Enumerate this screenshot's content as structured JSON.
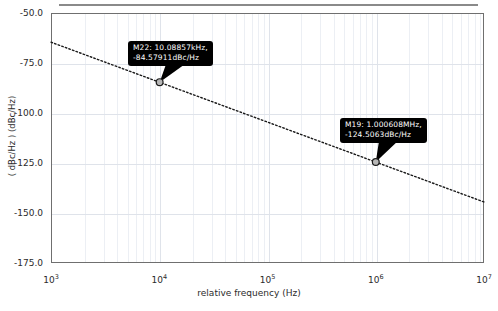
{
  "figure": {
    "title": "",
    "caption": ""
  },
  "axes": {
    "x": {
      "label": "relative frequency (Hz)",
      "scale": "log",
      "min": 1000,
      "max": 10000000,
      "tick_labels": [
        "10",
        "10",
        "10",
        "10",
        "10"
      ],
      "tick_exponents": [
        "3",
        "4",
        "5",
        "6",
        "7"
      ],
      "tick_values": [
        1000,
        10000,
        100000,
        1000000,
        10000000
      ]
    },
    "y": {
      "label": "( dBc/Hz ) (dBc/Hz)",
      "scale": "linear",
      "min": -175.0,
      "max": -50.0,
      "tick_labels": [
        "-50.0",
        "-75.0",
        "-100.0",
        "-125.0",
        "-150.0",
        "-175.0"
      ],
      "tick_values": [
        -50.0,
        -75.0,
        -100.0,
        -125.0,
        -150.0,
        -175.0
      ]
    }
  },
  "markers": [
    {
      "id": "M22",
      "line1": "M22: 10.08857kHz,",
      "line2": "-84.57911dBc/Hz",
      "freq_hz": 10088.57,
      "value_dbc_hz": -84.57911,
      "px": {
        "x": 162,
        "y": 84
      }
    },
    {
      "id": "M19",
      "line1": "M19: 1.000608MHz,",
      "line2": "-124.5063dBc/Hz",
      "freq_hz": 1000608,
      "value_dbc_hz": -124.5063,
      "px": {
        "x": 376,
        "y": 166
      }
    }
  ],
  "colors": {
    "trace": "#1a1a1a",
    "grid_major": "#dfe3ea",
    "grid_minor": "#eceff4",
    "frame": "#6f6f6f",
    "callout_bg": "#000000",
    "callout_fg": "#ffffff",
    "background": "#ffffff"
  },
  "chart_data": {
    "type": "line",
    "title": "",
    "xlabel": "relative frequency (Hz)",
    "ylabel": "( dBc/Hz ) (dBc/Hz)",
    "xscale": "log",
    "yscale": "linear",
    "xlim": [
      1000,
      10000000
    ],
    "ylim": [
      -175.0,
      -50.0
    ],
    "grid": true,
    "legend": "none",
    "linestyle": "dotted",
    "series": [
      {
        "name": "phase noise",
        "x": [
          1000,
          10000,
          100000,
          1000000,
          10000000
        ],
        "y": [
          -64.6,
          -84.6,
          -104.6,
          -124.5,
          -144.5
        ]
      }
    ],
    "annotations": [
      {
        "label": "M22: 10.08857kHz, -84.57911dBc/Hz",
        "x": 10088.57,
        "y": -84.57911
      },
      {
        "label": "M19: 1.000608MHz, -124.5063dBc/Hz",
        "x": 1000608,
        "y": -124.5063
      }
    ],
    "xticks": [
      1000,
      10000,
      100000,
      1000000,
      10000000
    ],
    "xticklabels": [
      "10^3",
      "10^4",
      "10^5",
      "10^6",
      "10^7"
    ],
    "yticks": [
      -50.0,
      -75.0,
      -100.0,
      -125.0,
      -150.0,
      -175.0
    ],
    "yticklabels": [
      "-50.0",
      "-75.0",
      "-100.0",
      "-125.0",
      "-150.0",
      "-175.0"
    ]
  }
}
